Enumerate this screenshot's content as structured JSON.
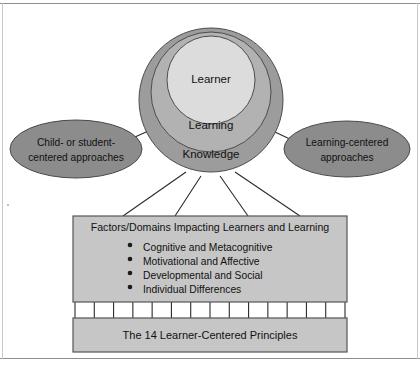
{
  "diagram": {
    "core": {
      "rings": [
        {
          "id": "inner",
          "label": "Learner",
          "fill": "#dcdcdc"
        },
        {
          "id": "middle",
          "label": "Learning",
          "fill": "#b2b2b2"
        },
        {
          "id": "outer",
          "label": "Knowledge",
          "fill": "#9c9c9c"
        }
      ]
    },
    "ellipses": [
      {
        "id": "left",
        "line1": "Child- or student-",
        "line2": "centered approaches",
        "fill": "#8c8c8c"
      },
      {
        "id": "right",
        "line1": "Learning-centered",
        "line2": "approaches",
        "fill": "#8c8c8c"
      }
    ],
    "factors_box": {
      "heading": "Factors/Domains Impacting Learners and Learning",
      "bullets": [
        "Cognitive and Metacognitive",
        "Motivational and Affective",
        "Developmental and Social",
        "Individual Differences"
      ],
      "fill": "#c6c6c6",
      "stroke": "#555555"
    },
    "principles_box": {
      "label": "The 14 Learner-Centered Principles",
      "fill": "#c6c6c6",
      "stroke": "#555555",
      "connector_count": 15,
      "segment_count": 14
    },
    "connectors": {
      "core_to_factors": 4,
      "ellipse_to_core": 2
    },
    "colors": {
      "line": "#2b2b2b",
      "frame": "#8d8d8d",
      "text": "#111111",
      "page_background": "#ffffff"
    }
  }
}
